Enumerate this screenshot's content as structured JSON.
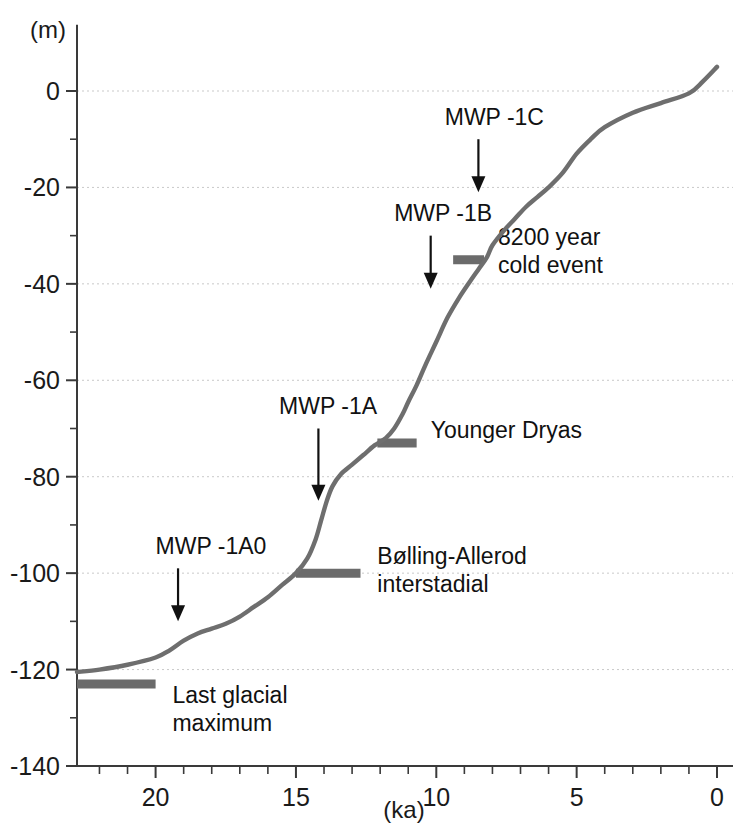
{
  "chart_data": {
    "type": "line",
    "title": "",
    "xlabel": "(ka)",
    "ylabel": "(m)",
    "xlim": [
      22.8,
      0
    ],
    "ylim": [
      -140,
      10
    ],
    "x_reversed": true,
    "grid": "horizontal-dotted-every-20m",
    "x_ticks_major": [
      20,
      15,
      10,
      5,
      0
    ],
    "x_ticks_major_labels": [
      "20",
      "15",
      "10",
      "5",
      "0"
    ],
    "x_tick_minor_step": 1,
    "y_ticks_major": [
      0,
      -20,
      -40,
      -60,
      -80,
      -100,
      -120,
      -140
    ],
    "y_ticks_major_labels": [
      "0",
      "-20",
      "-40",
      "-60",
      "-80",
      "-100",
      "-120",
      "-140"
    ],
    "y_tick_minor_step": 10,
    "series": [
      {
        "name": "Sea level",
        "color": "#6e6e6e",
        "x": [
          22.8,
          22.0,
          21.0,
          20.0,
          19.5,
          19.0,
          18.5,
          18.0,
          17.5,
          17.0,
          16.5,
          16.0,
          15.5,
          15.0,
          14.6,
          14.3,
          14.1,
          13.9,
          13.7,
          13.4,
          13.0,
          12.6,
          12.2,
          11.8,
          11.5,
          11.2,
          11.0,
          10.7,
          10.4,
          10.0,
          9.6,
          9.2,
          8.8,
          8.5,
          8.2,
          8.0,
          7.6,
          7.2,
          6.8,
          6.4,
          6.0,
          5.5,
          5.0,
          4.5,
          4.0,
          3.0,
          2.0,
          1.0,
          0.5,
          0.0
        ],
        "y": [
          -120.5,
          -120.0,
          -119.0,
          -117.5,
          -116.0,
          -114.0,
          -112.5,
          -111.5,
          -110.5,
          -109.0,
          -107.0,
          -105.0,
          -102.5,
          -100.0,
          -97.0,
          -93.0,
          -89.0,
          -85.0,
          -82.0,
          -79.5,
          -77.5,
          -75.5,
          -73.5,
          -72.0,
          -70.0,
          -67.0,
          -64.5,
          -61.0,
          -57.0,
          -52.0,
          -47.0,
          -43.0,
          -39.5,
          -37.0,
          -34.5,
          -32.0,
          -29.0,
          -26.5,
          -24.0,
          -22.0,
          -20.0,
          -17.0,
          -13.0,
          -10.0,
          -7.5,
          -4.5,
          -2.5,
          -0.5,
          2.0,
          5.0
        ]
      }
    ],
    "annotations": [
      {
        "id": "mwp-1a0",
        "label": "MWP -1A0",
        "label_x": 20.0,
        "label_y": -96,
        "arrow_x": 19.2,
        "arrow_y_start": -99,
        "arrow_y_end": -110
      },
      {
        "id": "mwp-1a",
        "label": "MWP -1A",
        "label_x": 15.6,
        "label_y": -67,
        "arrow_x": 14.2,
        "arrow_y_start": -70,
        "arrow_y_end": -85
      },
      {
        "id": "mwp-1b",
        "label": "MWP -1B",
        "label_x": 11.5,
        "label_y": -27,
        "arrow_x": 10.2,
        "arrow_y_start": -30,
        "arrow_y_end": -41
      },
      {
        "id": "mwp-1c",
        "label": "MWP -1C",
        "label_x": 9.7,
        "label_y": -7,
        "arrow_x": 8.5,
        "arrow_y_start": -10,
        "arrow_y_end": -21
      }
    ],
    "event_bars": [
      {
        "id": "last-glacial-maximum",
        "label": "Last glacial maximum",
        "label_lines": [
          "Last glacial",
          "maximum"
        ],
        "x_start": 22.8,
        "x_end": 20.0,
        "y": -123,
        "label_x": 19.4,
        "label_y": -127
      },
      {
        "id": "bolling-allerod-interstadial",
        "label": "Bølling-Allerod interstadial",
        "label_lines": [
          "Bølling-Allerod",
          "interstadial"
        ],
        "x_start": 15.0,
        "x_end": 12.7,
        "y": -100,
        "label_x": 12.1,
        "label_y": -98
      },
      {
        "id": "younger-dryas",
        "label": "Younger Dryas",
        "label_lines": [
          "Younger Dryas"
        ],
        "x_start": 12.1,
        "x_end": 10.7,
        "y": -73,
        "label_x": 10.2,
        "label_y": -72
      },
      {
        "id": "8200-year-cold-event",
        "label": "8200 year cold event",
        "label_lines": [
          "8200 year",
          "cold event"
        ],
        "x_start": 9.4,
        "x_end": 8.3,
        "y": -35,
        "label_x": 7.8,
        "label_y": -32
      }
    ]
  }
}
